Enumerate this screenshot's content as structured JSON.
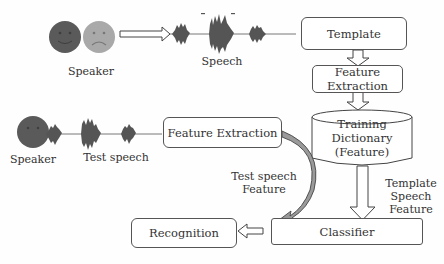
{
  "diagram": {
    "colors": {
      "face_dark": "#5a5a5a",
      "face_light": "#a9a9a9",
      "wave": "#555555",
      "border": "#555555",
      "curved_arrow_fill": "#9a9a9a"
    },
    "labels": {
      "speaker_top": "Speaker",
      "speech_top": "Speech",
      "speaker_bottom": "Speaker",
      "test_speech": "Test speech",
      "test_speech_feature_line1": "Test speech",
      "test_speech_feature_line2": "Feature",
      "template_speech_feature_line1": "Template",
      "template_speech_feature_line2": "Speech",
      "template_speech_feature_line3": "Feature"
    },
    "boxes": {
      "template": "Template",
      "feature_extraction_top_line1": "Feature",
      "feature_extraction_top_line2": "Extraction",
      "training_dictionary_line1": "Training",
      "training_dictionary_line2": "Dictionary",
      "training_dictionary_line3": "(Feature)",
      "feature_extraction_mid": "Feature Extraction",
      "classifier": "Classifier",
      "recognition": "Recognition"
    }
  }
}
